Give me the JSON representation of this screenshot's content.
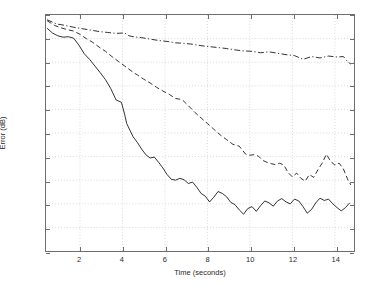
{
  "chart_data": {
    "type": "line",
    "title": "",
    "xlabel": "Time (seconds)",
    "ylabel": "Error (dB)",
    "xlim": [
      0.4,
      14.9
    ],
    "ylim": [
      -10,
      40
    ],
    "xticks": [
      2,
      4,
      6,
      8,
      10,
      12,
      14
    ],
    "yticks": [
      -10,
      -5,
      0,
      5,
      10,
      15,
      20,
      25,
      30,
      35,
      40
    ],
    "xtick_labels": [
      "2",
      "4",
      "6",
      "8",
      "10",
      "12",
      "14"
    ],
    "ytick_labels": [
      "-10",
      "-5",
      "0",
      "5",
      "10",
      "15",
      "20",
      "25",
      "30",
      "35",
      "40"
    ],
    "grid": true,
    "grid_color": "#c8c8c8",
    "axis_color": "#6e6e6e",
    "legend": null,
    "series": [
      {
        "name": "solid",
        "style": "solid",
        "color": "#1a1a1a",
        "x": [
          0.45,
          0.7,
          0.95,
          1.2,
          1.45,
          1.7,
          1.95,
          2.2,
          2.45,
          2.7,
          2.95,
          3.2,
          3.45,
          3.7,
          3.95,
          4.1,
          4.2,
          4.35,
          4.5,
          4.7,
          4.9,
          5.1,
          5.3,
          5.5,
          5.7,
          5.9,
          6.1,
          6.3,
          6.5,
          6.7,
          6.9,
          7.1,
          7.3,
          7.5,
          7.7,
          7.9,
          8.1,
          8.3,
          8.5,
          8.7,
          8.9,
          9.1,
          9.3,
          9.5,
          9.7,
          9.9,
          10.1,
          10.3,
          10.5,
          10.7,
          10.9,
          11.1,
          11.3,
          11.5,
          11.7,
          11.9,
          12.1,
          12.3,
          12.5,
          12.7,
          12.9,
          13.1,
          13.3,
          13.5,
          13.7,
          13.9,
          14.1,
          14.3,
          14.5,
          14.7
        ],
        "y": [
          37.2,
          36.2,
          35.6,
          35.3,
          35.4,
          35.1,
          33.6,
          31.8,
          30.6,
          29.2,
          27.8,
          26.3,
          24.4,
          22.0,
          21.5,
          19.0,
          17.0,
          15.6,
          14.2,
          13.0,
          11.6,
          10.4,
          9.7,
          9.9,
          8.8,
          7.6,
          6.2,
          5.2,
          5.0,
          5.4,
          5.1,
          4.3,
          4.6,
          3.5,
          2.2,
          1.6,
          0.4,
          1.4,
          2.6,
          2.2,
          1.5,
          0.3,
          -0.2,
          -1.3,
          -2.2,
          -1.0,
          -0.6,
          -1.6,
          -0.4,
          0.6,
          0.2,
          -0.5,
          0.6,
          1.1,
          0.4,
          0.0,
          1.0,
          0.6,
          -0.6,
          -2.0,
          -1.2,
          0.2,
          1.2,
          0.7,
          1.0,
          0.0,
          -0.8,
          -1.5,
          -0.8,
          0.2
        ]
      },
      {
        "name": "dashed",
        "style": "dashed",
        "color": "#1a1a1a",
        "x": [
          0.45,
          0.8,
          1.1,
          1.4,
          1.7,
          2.0,
          2.3,
          2.6,
          2.9,
          3.2,
          3.5,
          3.8,
          4.1,
          4.4,
          4.7,
          5.0,
          5.3,
          5.6,
          5.9,
          6.2,
          6.5,
          6.8,
          7.1,
          7.4,
          7.7,
          8.0,
          8.3,
          8.6,
          8.9,
          9.2,
          9.5,
          9.8,
          10.0,
          10.2,
          10.4,
          10.6,
          10.8,
          11.0,
          11.2,
          11.4,
          11.6,
          11.8,
          12.0,
          12.2,
          12.4,
          12.6,
          12.8,
          13.0,
          13.2,
          13.4,
          13.6,
          13.8,
          14.0,
          14.2,
          14.4,
          14.6,
          14.75
        ],
        "y": [
          38.8,
          37.8,
          37.3,
          36.9,
          36.6,
          35.9,
          35.0,
          34.2,
          33.2,
          32.3,
          31.2,
          30.2,
          29.2,
          28.2,
          27.3,
          26.4,
          25.6,
          24.7,
          23.9,
          23.2,
          22.3,
          22.1,
          20.8,
          19.4,
          18.2,
          17.0,
          15.8,
          14.6,
          13.6,
          12.6,
          12.2,
          10.5,
          10.3,
          10.4,
          10.1,
          9.2,
          8.8,
          8.5,
          8.3,
          8.6,
          8.2,
          6.6,
          5.7,
          6.5,
          5.4,
          4.8,
          6.2,
          5.6,
          7.2,
          8.6,
          10.5,
          9.0,
          8.2,
          8.6,
          7.4,
          5.2,
          4.0
        ]
      },
      {
        "name": "dash-dot",
        "style": "dashdot",
        "color": "#1a1a1a",
        "x": [
          0.45,
          0.9,
          1.3,
          1.7,
          2.1,
          2.5,
          2.9,
          3.3,
          3.7,
          4.1,
          4.3,
          4.5,
          4.9,
          5.3,
          5.7,
          6.1,
          6.5,
          6.9,
          7.3,
          7.7,
          8.1,
          8.5,
          8.9,
          9.3,
          9.7,
          10.1,
          10.5,
          10.9,
          11.3,
          11.7,
          12.1,
          12.5,
          12.9,
          13.3,
          13.7,
          14.1,
          14.4,
          14.6,
          14.75
        ],
        "y": [
          39.0,
          38.1,
          37.8,
          37.4,
          37.1,
          36.8,
          36.5,
          36.3,
          36.1,
          36.2,
          35.6,
          35.4,
          35.2,
          34.9,
          34.6,
          34.4,
          34.1,
          34.0,
          33.8,
          33.5,
          33.3,
          33.1,
          32.9,
          32.6,
          32.4,
          32.3,
          32.0,
          32.2,
          31.9,
          31.6,
          31.4,
          30.6,
          31.2,
          30.9,
          31.3,
          31.1,
          31.2,
          30.1,
          29.6
        ]
      }
    ]
  }
}
